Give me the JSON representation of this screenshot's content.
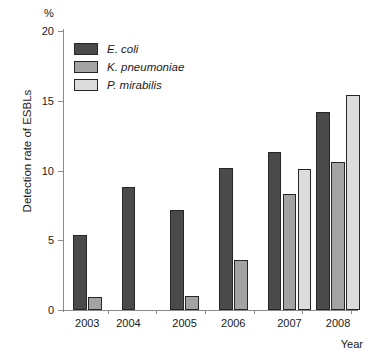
{
  "chart_data": {
    "type": "bar",
    "title": "",
    "xlabel": "Year",
    "ylabel": "Detection rate of ESBLs",
    "unit_label": "%",
    "categories": [
      "2003",
      "2004",
      "2005",
      "2006",
      "2007",
      "2008"
    ],
    "series": [
      {
        "name": "E. coli",
        "color": "#4a4a4a",
        "values": [
          5.4,
          8.8,
          7.2,
          10.2,
          11.3,
          14.2
        ]
      },
      {
        "name": "K. pneumoniae",
        "color": "#a3a3a3",
        "values": [
          0.9,
          null,
          1.0,
          3.6,
          8.3,
          10.6
        ]
      },
      {
        "name": "P. mirabilis",
        "color": "#dcdcdc",
        "values": [
          null,
          null,
          null,
          null,
          10.1,
          15.4
        ]
      }
    ],
    "ylim": [
      0,
      20
    ],
    "yticks": [
      0,
      5,
      10,
      15,
      20
    ],
    "ytick_labels": [
      "0",
      "5",
      "10",
      "15",
      "20"
    ],
    "grid": false,
    "legend_position": "upper-left-inside"
  }
}
